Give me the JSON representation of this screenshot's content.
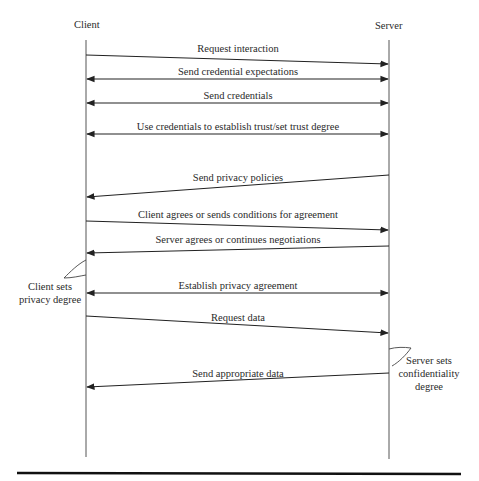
{
  "diagram": {
    "type": "sequence",
    "participants": [
      {
        "name": "Client",
        "x": 86
      },
      {
        "name": "Server",
        "x": 389
      }
    ],
    "messages": [
      {
        "label": "Request interaction",
        "from": "Client",
        "to": "Server",
        "y1": 55,
        "y2": 64,
        "direction": "right"
      },
      {
        "label": "Send credential expectations",
        "from": "Client",
        "to": "Server",
        "y1": 79,
        "y2": 79,
        "direction": "both"
      },
      {
        "label": "Send credentials",
        "from": "Client",
        "to": "Server",
        "y1": 103,
        "y2": 103,
        "direction": "both"
      },
      {
        "label": "Use credentials to establish trust/set trust degree",
        "from": "Client",
        "to": "Server",
        "y1": 134,
        "y2": 134,
        "direction": "both"
      },
      {
        "label": "Send privacy policies",
        "from": "Server",
        "to": "Client",
        "y1": 175,
        "y2": 197,
        "direction": "left"
      },
      {
        "label": "Client agrees or sends conditions for agreement",
        "from": "Client",
        "to": "Server",
        "y1": 221,
        "y2": 230,
        "direction": "right"
      },
      {
        "label": "Server agrees or continues negotiations",
        "from": "Server",
        "to": "Client",
        "y1": 246,
        "y2": 253,
        "direction": "left"
      },
      {
        "label": "Establish privacy agreement",
        "from": "Client",
        "to": "Server",
        "y1": 293,
        "y2": 293,
        "direction": "both"
      },
      {
        "label": "Request data",
        "from": "Client",
        "to": "Server",
        "y1": 316,
        "y2": 333,
        "direction": "right"
      },
      {
        "label": "Send appropriate data",
        "from": "Server",
        "to": "Client",
        "y1": 373,
        "y2": 387,
        "direction": "left"
      }
    ],
    "notes": [
      {
        "participant": "Client",
        "lines": [
          "Client sets",
          "privacy degree"
        ]
      },
      {
        "participant": "Server",
        "lines": [
          "Server sets",
          "confidentiality",
          "degree"
        ]
      }
    ]
  }
}
